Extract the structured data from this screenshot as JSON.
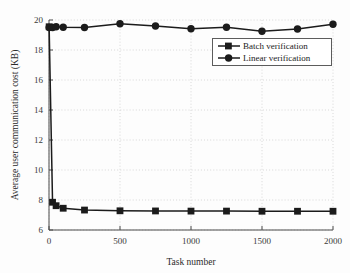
{
  "chart_data": {
    "type": "line",
    "title": "",
    "xlabel": "Task number",
    "ylabel": "Average user communication cost (KB)",
    "xlim": [
      0,
      2000
    ],
    "ylim": [
      6,
      20
    ],
    "xticks": [
      0,
      500,
      1000,
      1500,
      2000
    ],
    "xtick_labels": [
      "0",
      "500",
      "1000",
      "1500",
      "2000"
    ],
    "yticks": [
      6,
      8,
      10,
      12,
      14,
      16,
      18,
      20
    ],
    "ytick_labels": [
      "6",
      "8",
      "10",
      "12",
      "14",
      "16",
      "18",
      "20"
    ],
    "grid": true,
    "grid_style": "dotted",
    "legend_position": "upper right",
    "x": [
      1,
      25,
      50,
      100,
      250,
      500,
      750,
      1000,
      1250,
      1500,
      1750,
      2000
    ],
    "series": [
      {
        "name": "Batch verification",
        "marker": "square",
        "color": "#1b1b1b",
        "values": [
          19.55,
          7.85,
          7.62,
          7.45,
          7.33,
          7.28,
          7.27,
          7.26,
          7.26,
          7.25,
          7.25,
          7.25
        ]
      },
      {
        "name": "Linear verification",
        "marker": "circle",
        "color": "#1b1b1b",
        "values": [
          19.5,
          19.5,
          19.55,
          19.52,
          19.5,
          19.75,
          19.6,
          19.42,
          19.52,
          19.25,
          19.4,
          19.72
        ]
      }
    ]
  },
  "legend": {
    "entries": [
      {
        "label": "Batch verification",
        "marker": "square"
      },
      {
        "label": "Linear verification",
        "marker": "circle"
      }
    ]
  },
  "colors": {
    "ink": "#1b1b1b",
    "frame": "#4a4a4a",
    "grid": "#c9c9c9",
    "background": "#fdfdfd"
  }
}
